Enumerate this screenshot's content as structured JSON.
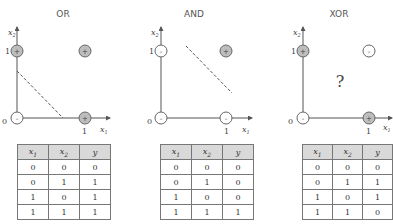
{
  "panels": [
    {
      "title": "OR",
      "axis": {
        "x_label": "x",
        "x_sub": "1",
        "y_label": "x",
        "y_sub": "2",
        "origin_tick": "0",
        "x_tick": "1",
        "y_tick": "1"
      },
      "points": [
        {
          "x1": 0,
          "x2": 0,
          "sign": "-"
        },
        {
          "x1": 0,
          "x2": 1,
          "sign": "+"
        },
        {
          "x1": 1,
          "x2": 0,
          "sign": "+"
        },
        {
          "x1": 1,
          "x2": 1,
          "sign": "+"
        }
      ],
      "separator": "dashed line separating (0,0) from others",
      "table": {
        "headers": [
          "x1",
          "x2",
          "y"
        ],
        "rows": [
          [
            "0",
            "0",
            "0"
          ],
          [
            "0",
            "1",
            "1"
          ],
          [
            "1",
            "0",
            "1"
          ],
          [
            "1",
            "1",
            "1"
          ]
        ]
      }
    },
    {
      "title": "AND",
      "axis": {
        "x_label": "x",
        "x_sub": "1",
        "y_label": "x",
        "y_sub": "2",
        "origin_tick": "0",
        "x_tick": "1",
        "y_tick": "1"
      },
      "points": [
        {
          "x1": 0,
          "x2": 0,
          "sign": "-"
        },
        {
          "x1": 0,
          "x2": 1,
          "sign": "-"
        },
        {
          "x1": 1,
          "x2": 0,
          "sign": "-"
        },
        {
          "x1": 1,
          "x2": 1,
          "sign": "+"
        }
      ],
      "separator": "dashed line separating (1,1) from others",
      "table": {
        "headers": [
          "x1",
          "x2",
          "y"
        ],
        "rows": [
          [
            "0",
            "0",
            "0"
          ],
          [
            "0",
            "1",
            "0"
          ],
          [
            "1",
            "0",
            "0"
          ],
          [
            "1",
            "1",
            "1"
          ]
        ]
      }
    },
    {
      "title": "XOR",
      "axis": {
        "x_label": "x",
        "x_sub": "1",
        "y_label": "x",
        "y_sub": "2",
        "origin_tick": "0",
        "x_tick": "1",
        "y_tick": "1"
      },
      "points": [
        {
          "x1": 0,
          "x2": 0,
          "sign": "-"
        },
        {
          "x1": 0,
          "x2": 1,
          "sign": "+"
        },
        {
          "x1": 1,
          "x2": 0,
          "sign": "+"
        },
        {
          "x1": 1,
          "x2": 1,
          "sign": "-"
        }
      ],
      "question": "?",
      "table": {
        "headers": [
          "x1",
          "x2",
          "y"
        ],
        "rows": [
          [
            "0",
            "0",
            "0"
          ],
          [
            "0",
            "1",
            "1"
          ],
          [
            "1",
            "0",
            "1"
          ],
          [
            "1",
            "1",
            "0"
          ]
        ]
      }
    }
  ],
  "colors": {
    "positive_fill": "#bdbdbd",
    "negative_fill": "#ffffff",
    "stroke": "#666666",
    "header_bg": "#d9d9d9"
  }
}
